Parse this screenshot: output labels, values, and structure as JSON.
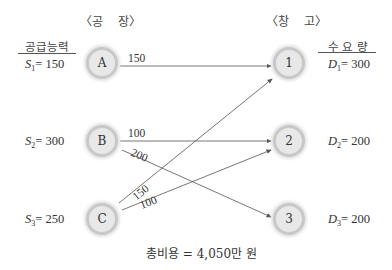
{
  "headers": {
    "factory": "〈공    장〉",
    "warehouse": "〈창    고〉",
    "supply_capacity": "공급능력",
    "demand": "수 요 량"
  },
  "factories": [
    {
      "id": "A",
      "supply_symbol": "S",
      "sub": "1",
      "supply_value": "= 150"
    },
    {
      "id": "B",
      "supply_symbol": "S",
      "sub": "2",
      "supply_value": "= 300"
    },
    {
      "id": "C",
      "supply_symbol": "S",
      "sub": "3",
      "supply_value": "= 250"
    }
  ],
  "warehouses": [
    {
      "id": "1",
      "demand_symbol": "D",
      "sub": "1",
      "demand_value": "= 300"
    },
    {
      "id": "2",
      "demand_symbol": "D",
      "sub": "2",
      "demand_value": "= 200"
    },
    {
      "id": "3",
      "demand_symbol": "D",
      "sub": "3",
      "demand_value": "= 200"
    }
  ],
  "flows": [
    {
      "from": "A",
      "to": "1",
      "amount": "150"
    },
    {
      "from": "B",
      "to": "2",
      "amount": "100"
    },
    {
      "from": "B",
      "to": "3",
      "amount": "200"
    },
    {
      "from": "C",
      "to": "1",
      "amount": "150"
    },
    {
      "from": "C",
      "to": "2",
      "amount": "100"
    }
  ],
  "total_cost": "총비용 = 4,050만 원"
}
